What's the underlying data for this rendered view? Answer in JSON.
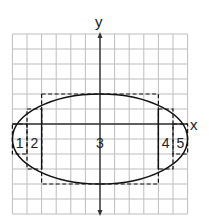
{
  "diagram": {
    "type": "ellipse-area-approximation",
    "axes": {
      "x_label": "x",
      "y_label": "y"
    },
    "grid": {
      "x_range": [
        -6,
        6
      ],
      "y_range": [
        -6,
        6
      ],
      "step": 1
    },
    "ellipse": {
      "center": [
        0,
        -1
      ],
      "semi_axis_x": 6,
      "semi_axis_y": 3
    },
    "rectangles": [
      {
        "label": "1",
        "x": [
          -6,
          -5
        ],
        "y": [
          -2,
          0
        ]
      },
      {
        "label": "2",
        "x": [
          -5,
          -4
        ],
        "y": [
          -3,
          1
        ]
      },
      {
        "label": "3",
        "x": [
          -4,
          4
        ],
        "y": [
          -4,
          2
        ]
      },
      {
        "label": "4",
        "x": [
          4,
          5
        ],
        "y": [
          -3,
          1
        ]
      },
      {
        "label": "5",
        "x": [
          5,
          6
        ],
        "y": [
          -2,
          0
        ]
      }
    ],
    "colors": {
      "grid": "#b8b8b8",
      "axes": "#333333",
      "curve": "#111111",
      "rect": "#111111"
    }
  }
}
